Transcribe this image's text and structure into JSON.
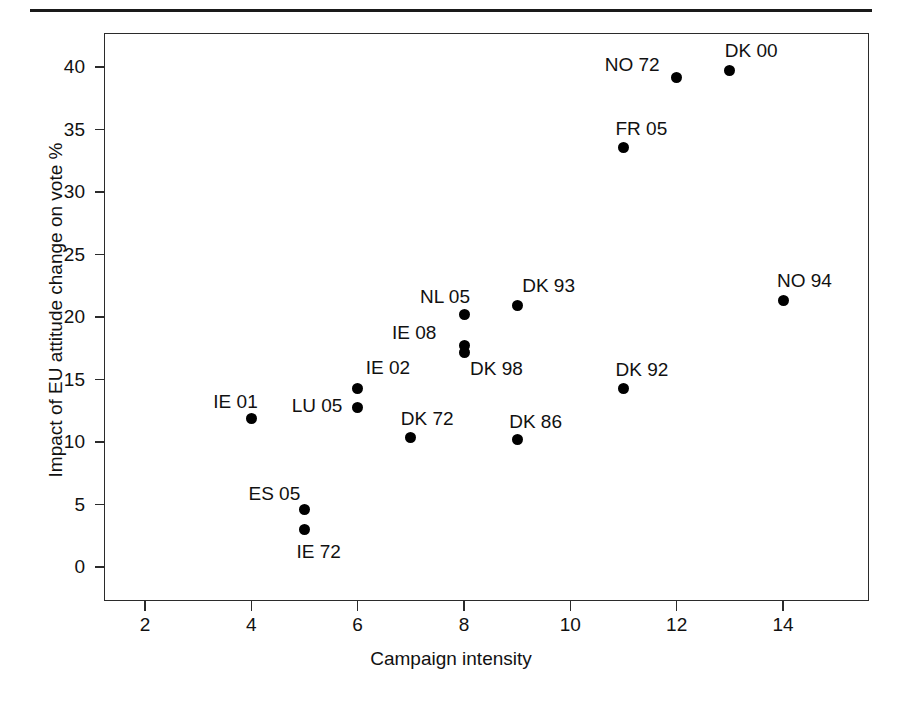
{
  "figure": {
    "background": "#ffffff",
    "foreground": "#111111",
    "point_color": "#000000"
  },
  "chart_data": {
    "type": "scatter",
    "title": "",
    "xlabel": "Campaign intensity",
    "ylabel": "Impact of EU attitude change on vote %",
    "xlim": [
      1.2,
      15.4
    ],
    "ylim": [
      -1.6,
      42.4
    ],
    "xticks": [
      2,
      4,
      6,
      8,
      10,
      12,
      14
    ],
    "xtick_labels": [
      "2",
      "4",
      "6",
      "8",
      "10",
      "12",
      "14"
    ],
    "yticks": [
      0,
      5,
      10,
      15,
      20,
      25,
      30,
      35,
      40
    ],
    "ytick_labels": [
      "0",
      "5",
      "10",
      "15",
      "20",
      "25",
      "30",
      "35",
      "40"
    ],
    "grid": false,
    "legend": false,
    "marker": "filled-circle",
    "points": [
      {
        "label": "IE 01",
        "x": 4,
        "y": 11.9,
        "label_dx": -38,
        "label_dy": -26
      },
      {
        "label": "ES 05",
        "x": 5,
        "y": 4.6,
        "label_dx": -56,
        "label_dy": -26
      },
      {
        "label": "IE 72",
        "x": 5,
        "y": 3.0,
        "label_dx": -8,
        "label_dy": 12
      },
      {
        "label": "LU 05",
        "x": 6,
        "y": 12.8,
        "label_dx": -66,
        "label_dy": -11
      },
      {
        "label": "IE 02",
        "x": 6,
        "y": 14.3,
        "label_dx": 8,
        "label_dy": -30
      },
      {
        "label": "DK 72",
        "x": 7,
        "y": 10.4,
        "label_dx": -10,
        "label_dy": -28
      },
      {
        "label": "NL 05",
        "x": 8,
        "y": 20.2,
        "label_dx": -44,
        "label_dy": -28
      },
      {
        "label": "IE 08",
        "x": 8,
        "y": 17.7,
        "label_dx": -72,
        "label_dy": -23
      },
      {
        "label": "DK 98",
        "x": 8,
        "y": 17.2,
        "label_dx": 6,
        "label_dy": 7
      },
      {
        "label": "DK 86",
        "x": 9,
        "y": 10.2,
        "label_dx": -8,
        "label_dy": -28
      },
      {
        "label": "DK 93",
        "x": 9,
        "y": 20.9,
        "label_dx": 5,
        "label_dy": -30
      },
      {
        "label": "FR 05",
        "x": 11,
        "y": 33.6,
        "label_dx": -8,
        "label_dy": -28
      },
      {
        "label": "DK 92",
        "x": 11,
        "y": 14.3,
        "label_dx": -8,
        "label_dy": -28
      },
      {
        "label": "NO 72",
        "x": 12,
        "y": 39.2,
        "label_dx": -72,
        "label_dy": -22
      },
      {
        "label": "DK 00",
        "x": 13,
        "y": 39.7,
        "label_dx": -5,
        "label_dy": -30
      },
      {
        "label": "NO 94",
        "x": 14,
        "y": 21.3,
        "label_dx": -6,
        "label_dy": -30
      }
    ]
  }
}
